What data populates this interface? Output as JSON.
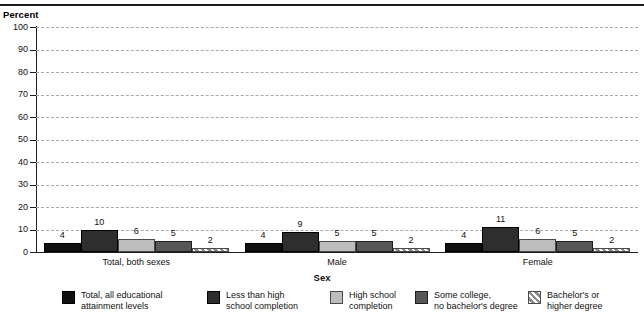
{
  "header": {
    "y_axis_unit_label": "Percent"
  },
  "chart_data": {
    "type": "bar",
    "title": "",
    "xlabel": "Sex",
    "ylabel": "Percent",
    "ylim": [
      0,
      100
    ],
    "yticks": [
      0,
      10,
      20,
      30,
      40,
      50,
      60,
      70,
      80,
      90,
      100
    ],
    "grid": true,
    "legend_position": "bottom",
    "categories": [
      "Total, both sexes",
      "Male",
      "Female"
    ],
    "series": [
      {
        "name": "Total, all educational attainment levels",
        "legend_label": "Total, all educational\nattainment levels",
        "color": "#111111",
        "values": [
          4,
          10,
          4
        ]
      },
      {
        "name": "Less than high school completion",
        "legend_label": "Less than high\nschool completion",
        "color": "#2e2e2e",
        "values": [
          10,
          9,
          11
        ]
      },
      {
        "name": "High school completion",
        "legend_label": "High school\ncompletion",
        "color": "#bdbdbd",
        "values": [
          6,
          5,
          6
        ]
      },
      {
        "name": "Some college, no bachelor's degree",
        "legend_label": "Some college,\nno bachelor's degree",
        "color": "#575757",
        "values": [
          5,
          5,
          5
        ]
      },
      {
        "name": "Bachelor's or higher degree",
        "legend_label": "Bachelor's or\nhigher degree",
        "color": "#8a8a8a",
        "values": [
          2,
          2,
          2
        ]
      }
    ],
    "groups": [
      {
        "label": "Total, both sexes",
        "values": [
          4,
          10,
          6,
          5,
          2
        ]
      },
      {
        "label": "Male",
        "values": [
          4,
          9,
          5,
          5,
          2
        ]
      },
      {
        "label": "Female",
        "values": [
          4,
          11,
          6,
          5,
          2
        ]
      }
    ]
  }
}
